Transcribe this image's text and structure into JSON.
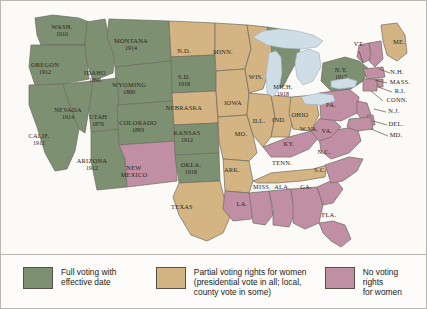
{
  "map": {
    "title": "Women's Voting Rights by State",
    "colors": {
      "full": "#7d9071",
      "partial": "#d4b483",
      "none": "#c08fa4",
      "water": "#cfdde6",
      "border": "#6e6a60",
      "background": "#fbfaf7"
    },
    "states": [
      {
        "code": "WA",
        "name": "WASH.",
        "year": "1910",
        "status": "full",
        "x": 61,
        "y": 30
      },
      {
        "code": "OR",
        "name": "OREGON",
        "year": "1912",
        "status": "full",
        "x": 44,
        "y": 68
      },
      {
        "code": "CA",
        "name": "CALIF.",
        "year": "1911",
        "status": "full",
        "x": 38,
        "y": 139
      },
      {
        "code": "NV",
        "name": "NEVADA",
        "year": "1914",
        "status": "full",
        "x": 67,
        "y": 113
      },
      {
        "code": "ID",
        "name": "IDAHO",
        "year": "1896",
        "status": "full",
        "x": 94,
        "y": 76
      },
      {
        "code": "MT",
        "name": "MONTANA",
        "year": "1914",
        "status": "full",
        "x": 130,
        "y": 44
      },
      {
        "code": "WY",
        "name": "WYOMING",
        "year": "1890",
        "status": "full",
        "x": 128,
        "y": 88
      },
      {
        "code": "UT",
        "name": "UTAH",
        "year": "1870",
        "status": "full",
        "x": 97,
        "y": 120
      },
      {
        "code": "AZ",
        "name": "ARIZONA",
        "year": "1912",
        "status": "full",
        "x": 91,
        "y": 164
      },
      {
        "code": "CO",
        "name": "COLORADO",
        "year": "1893",
        "status": "full",
        "x": 137,
        "y": 126
      },
      {
        "code": "NM",
        "name": "NEW\nMEXICO",
        "year": "",
        "status": "none",
        "x": 133,
        "y": 171
      },
      {
        "code": "ND",
        "name": "N.D.",
        "year": "",
        "status": "partial",
        "x": 183,
        "y": 51
      },
      {
        "code": "SD",
        "name": "S.D.",
        "year": "1918",
        "status": "full",
        "x": 183,
        "y": 80
      },
      {
        "code": "NE",
        "name": "NEBRASKA",
        "year": "",
        "status": "partial",
        "x": 183,
        "y": 108
      },
      {
        "code": "KS",
        "name": "KANSAS",
        "year": "1912",
        "status": "full",
        "x": 186,
        "y": 136
      },
      {
        "code": "OK",
        "name": "OKLA.",
        "year": "1918",
        "status": "full",
        "x": 190,
        "y": 168
      },
      {
        "code": "TX",
        "name": "TEXAS",
        "year": "",
        "status": "partial",
        "x": 181,
        "y": 207
      },
      {
        "code": "MN",
        "name": "MINN.",
        "year": "",
        "status": "partial",
        "x": 222,
        "y": 52
      },
      {
        "code": "IA",
        "name": "IOWA",
        "year": "",
        "status": "partial",
        "x": 232,
        "y": 103
      },
      {
        "code": "MO",
        "name": "MO.",
        "year": "",
        "status": "partial",
        "x": 240,
        "y": 134
      },
      {
        "code": "AR",
        "name": "ARK.",
        "year": "",
        "status": "partial",
        "x": 231,
        "y": 170
      },
      {
        "code": "LA",
        "name": "LA.",
        "year": "",
        "status": "none",
        "x": 241,
        "y": 204
      },
      {
        "code": "WI",
        "name": "WIS.",
        "year": "",
        "status": "partial",
        "x": 255,
        "y": 77
      },
      {
        "code": "IL",
        "name": "ILL.",
        "year": "",
        "status": "partial",
        "x": 258,
        "y": 121
      },
      {
        "code": "IN",
        "name": "IND.",
        "year": "",
        "status": "partial",
        "x": 278,
        "y": 120
      },
      {
        "code": "MI",
        "name": "MICH.",
        "year": "1918",
        "status": "full",
        "x": 282,
        "y": 90
      },
      {
        "code": "OH",
        "name": "OHIO",
        "year": "",
        "status": "partial",
        "x": 299,
        "y": 115
      },
      {
        "code": "KY",
        "name": "KY.",
        "year": "",
        "status": "none",
        "x": 288,
        "y": 144
      },
      {
        "code": "TN",
        "name": "TENN.",
        "year": "",
        "status": "partial",
        "x": 281,
        "y": 163
      },
      {
        "code": "MS",
        "name": "MISS.",
        "year": "",
        "status": "none",
        "x": 261,
        "y": 187
      },
      {
        "code": "AL",
        "name": "ALA.",
        "year": "",
        "status": "none",
        "x": 281,
        "y": 187
      },
      {
        "code": "GA",
        "name": "GA.",
        "year": "",
        "status": "none",
        "x": 305,
        "y": 187
      },
      {
        "code": "FL",
        "name": "FLA.",
        "year": "",
        "status": "none",
        "x": 328,
        "y": 215
      },
      {
        "code": "SC",
        "name": "S.C.",
        "year": "",
        "status": "none",
        "x": 319,
        "y": 170
      },
      {
        "code": "NC",
        "name": "N.C.",
        "year": "",
        "status": "none",
        "x": 323,
        "y": 152
      },
      {
        "code": "VA",
        "name": "VA.",
        "year": "",
        "status": "none",
        "x": 326,
        "y": 131
      },
      {
        "code": "WV",
        "name": "W.VA.",
        "year": "",
        "status": "none",
        "x": 308,
        "y": 129
      },
      {
        "code": "PA",
        "name": "PA.",
        "year": "",
        "status": "none",
        "x": 330,
        "y": 105
      },
      {
        "code": "NY",
        "name": "N.Y.",
        "year": "1917",
        "status": "full",
        "x": 340,
        "y": 73
      },
      {
        "code": "ME",
        "name": "ME.",
        "year": "",
        "status": "partial",
        "x": 398,
        "y": 42
      },
      {
        "code": "VT",
        "name": "VT.",
        "year": "",
        "status": "none",
        "x": 358,
        "y": 44
      },
      {
        "code": "NH",
        "name": "N.H.",
        "year": "",
        "status": "none",
        "x": 396,
        "y": 72
      },
      {
        "code": "MA",
        "name": "MASS.",
        "year": "",
        "status": "none",
        "x": 399,
        "y": 82
      },
      {
        "code": "RI",
        "name": "R.I.",
        "year": "",
        "status": "none",
        "x": 399,
        "y": 91
      },
      {
        "code": "CT",
        "name": "CONN.",
        "year": "",
        "status": "none",
        "x": 396,
        "y": 100
      },
      {
        "code": "NJ",
        "name": "N.J.",
        "year": "",
        "status": "none",
        "x": 393,
        "y": 111
      },
      {
        "code": "DE",
        "name": "DEL.",
        "year": "",
        "status": "none",
        "x": 395,
        "y": 124
      },
      {
        "code": "MD",
        "name": "MD.",
        "year": "",
        "status": "none",
        "x": 395,
        "y": 135
      }
    ]
  },
  "legend": {
    "items": [
      {
        "key": "full",
        "status_color": "#7d9071",
        "label": "Full voting with\neffective date"
      },
      {
        "key": "partial",
        "status_color": "#d4b483",
        "label": "Partial voting rights for women\n(presidential vote in all; local,\ncounty vote in some)"
      },
      {
        "key": "none",
        "status_color": "#c08fa4",
        "label": "No voting rights\nfor women"
      }
    ]
  }
}
